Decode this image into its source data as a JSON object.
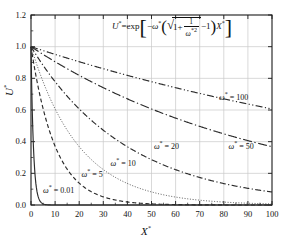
{
  "chart_data": {
    "type": "line",
    "title": "",
    "equation_text": "U* = exp[-ω*(sqrt(1 + 1/ω*^2) - 1) X*]",
    "xlabel": "X*",
    "ylabel": "U*",
    "xlim": [
      0,
      100
    ],
    "ylim": [
      0.0,
      1.2
    ],
    "xticks": [
      0,
      10,
      20,
      30,
      40,
      50,
      60,
      70,
      80,
      90,
      100
    ],
    "yticks": [
      "0.0",
      "0.2",
      "0.4",
      "0.6",
      "0.8",
      "1.0",
      "1.2"
    ],
    "grid": true,
    "legend": "inline-annotations",
    "x": [
      0,
      2,
      5,
      10,
      20,
      30,
      40,
      50,
      60,
      70,
      80,
      90,
      100
    ],
    "series": [
      {
        "name": "ω* = 0.01",
        "omega": 0.01,
        "style": "solid",
        "decay": 0.99,
        "values": [
          1.0,
          0.138,
          0.007,
          0.0,
          0.0,
          0.0,
          0.0,
          0.0,
          0.0,
          0.0,
          0.0,
          0.0,
          0.0
        ]
      },
      {
        "name": "ω* = 5",
        "omega": 5,
        "style": "dashed",
        "decay": 0.099,
        "values": [
          1.0,
          0.821,
          0.61,
          0.372,
          0.138,
          0.051,
          0.019,
          0.007,
          0.003,
          0.001,
          0.0,
          0.0,
          0.0
        ]
      },
      {
        "name": "ω* = 10",
        "omega": 10,
        "style": "dotted",
        "decay": 0.0499,
        "values": [
          1.0,
          0.905,
          0.779,
          0.607,
          0.369,
          0.224,
          0.136,
          0.082,
          0.05,
          0.03,
          0.018,
          0.011,
          0.007
        ]
      },
      {
        "name": "ω* = 20",
        "omega": 20,
        "style": "dash-dot",
        "decay": 0.025,
        "values": [
          1.0,
          0.951,
          0.883,
          0.779,
          0.607,
          0.473,
          0.368,
          0.287,
          0.223,
          0.174,
          0.135,
          0.105,
          0.082
        ]
      },
      {
        "name": "ω* = 50",
        "omega": 50,
        "style": "long-dash-dot",
        "decay": 0.01,
        "values": [
          1.0,
          0.98,
          0.951,
          0.905,
          0.819,
          0.741,
          0.67,
          0.607,
          0.549,
          0.497,
          0.449,
          0.407,
          0.368
        ]
      },
      {
        "name": "ω* = 100",
        "omega": 100,
        "style": "dash-dot-dot",
        "decay": 0.005,
        "values": [
          1.0,
          0.99,
          0.975,
          0.951,
          0.905,
          0.861,
          0.819,
          0.779,
          0.741,
          0.705,
          0.67,
          0.638,
          0.607
        ]
      }
    ],
    "annotations": [
      {
        "text": "ω* = 0.01",
        "x": 5,
        "y": 0.1
      },
      {
        "text": "ω* = 5",
        "x": 21,
        "y": 0.2
      },
      {
        "text": "ω* = 10",
        "x": 33,
        "y": 0.27
      },
      {
        "text": "ω* = 20",
        "x": 51,
        "y": 0.38
      },
      {
        "text": "ω* = 50",
        "x": 82,
        "y": 0.38
      },
      {
        "text": "ω* = 100",
        "x": 78,
        "y": 0.69
      }
    ],
    "colors": {
      "axis": "#1a1a1a",
      "grid": "#c9c9c9",
      "curve": "#2b2b2b",
      "background": "#ffffff"
    }
  },
  "axes": {
    "y_title": "U",
    "y_title_sup": "*",
    "x_title": "X",
    "x_title_sup": "*"
  },
  "equation": {
    "lhs": "U",
    "lhs_sup": "*",
    "eq": "=",
    "exp": "exp",
    "minus": "−",
    "omega": "ω",
    "omega_sup": "*",
    "one": "1",
    "plus": "+",
    "numerator": "1",
    "denominator_omega": "ω",
    "denominator_sup": "*2",
    "minus_one": "−1",
    "x_var": "X",
    "x_sup": "*"
  },
  "labels": {
    "yticks": [
      "1.2",
      "1.0",
      "0.8",
      "0.6",
      "0.4",
      "0.2",
      "0.0"
    ],
    "xticks": [
      "0",
      "10",
      "20",
      "30",
      "40",
      "50",
      "60",
      "70",
      "80",
      "90",
      "100"
    ],
    "curves": [
      "ω* = 100",
      "ω* = 50",
      "ω* = 20",
      "ω* = 10",
      "ω* = 5",
      "ω* = 0.01"
    ]
  }
}
